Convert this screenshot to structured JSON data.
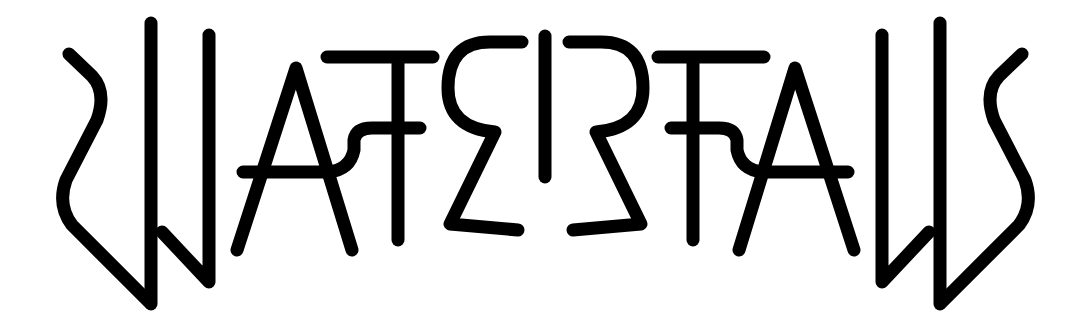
{
  "logo": {
    "word": "WATERFALLS",
    "style": "mirror-symmetric ambigram",
    "ink_color": "#000000",
    "background_color": "#ffffff"
  }
}
